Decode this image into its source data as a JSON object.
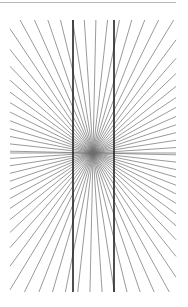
{
  "title": "",
  "chart_data": {
    "type": "diagram",
    "name": "Hering illusion",
    "center": [
      93,
      153
    ],
    "bounds": {
      "left": 10,
      "right": 176,
      "top": 20,
      "bottom": 292
    },
    "ray_count": 72,
    "ray_color": "#6e6e6e",
    "ray_width": 0.7,
    "vertical_lines": [
      {
        "x": 73,
        "y1": 20,
        "y2": 292
      },
      {
        "x": 114,
        "y1": 20,
        "y2": 292
      }
    ],
    "vertical_color": "#222222",
    "vertical_width": 1.6
  }
}
